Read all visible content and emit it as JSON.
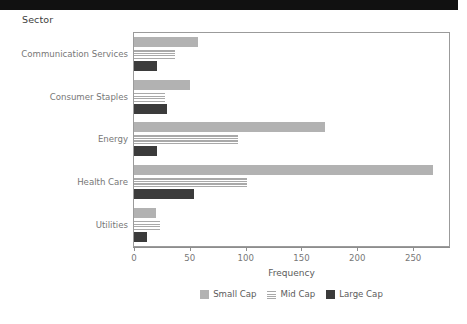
{
  "header": {
    "bar_color": "#111111"
  },
  "panel": {
    "title": "Sector"
  },
  "chart_data": {
    "type": "bar",
    "orientation": "horizontal",
    "title": "Sector",
    "xlabel": "Frequency",
    "ylabel": "Sector",
    "categories": [
      "Communication Services",
      "Consumer Staples",
      "Energy",
      "Health Care",
      "Utilities"
    ],
    "series": [
      {
        "name": "Small Cap",
        "color": "#b2b2b2",
        "pattern": "solid",
        "values": [
          57,
          50,
          171,
          268,
          20
        ]
      },
      {
        "name": "Mid Cap",
        "color": "#a9a9a9",
        "pattern": "horizontal-stripes",
        "values": [
          37,
          28,
          93,
          101,
          23
        ]
      },
      {
        "name": "Large Cap",
        "color": "#3b3b3b",
        "pattern": "solid",
        "values": [
          21,
          30,
          21,
          54,
          12
        ]
      }
    ],
    "xticks": [
      0,
      50,
      100,
      150,
      200,
      250
    ],
    "xlim": [
      0,
      283
    ],
    "grid": false,
    "legend_position": "bottom",
    "legend_entries": [
      "Small Cap",
      "Mid Cap",
      "Large Cap"
    ]
  }
}
